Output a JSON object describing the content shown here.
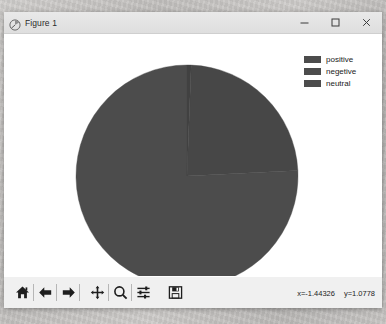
{
  "window": {
    "title": "Figure 1",
    "icon": "matplotlib-figure-icon",
    "minimize_label": "–",
    "maximize_label": "□",
    "close_label": "×"
  },
  "legend": {
    "position": "upper right",
    "items": [
      {
        "label": "positive",
        "color": "#4c4c4c"
      },
      {
        "label": "negetive",
        "color": "#4c4c4c"
      },
      {
        "label": "neutral",
        "color": "#4c4c4c"
      }
    ]
  },
  "toolbar": {
    "buttons": [
      {
        "name": "home-icon",
        "tooltip": "Reset original view"
      },
      {
        "name": "back-arrow-icon",
        "tooltip": "Back to previous view"
      },
      {
        "name": "forward-arrow-icon",
        "tooltip": "Forward to next view"
      },
      {
        "name": "pan-move-icon",
        "tooltip": "Pan axes with left mouse, zoom with right"
      },
      {
        "name": "zoom-rect-icon",
        "tooltip": "Zoom to rectangle"
      },
      {
        "name": "configure-subplots-icon",
        "tooltip": "Configure subplots"
      },
      {
        "name": "save-disk-icon",
        "tooltip": "Save the figure"
      }
    ],
    "coordinates": {
      "x": "x=-1.44326",
      "y": "y=1.0778"
    }
  },
  "chart_data": {
    "type": "pie",
    "title": "",
    "labels": [
      "positive",
      "negetive",
      "neutral"
    ],
    "values": [
      75.8,
      23.6,
      0.6
    ],
    "units": "percent",
    "colors": [
      "#4c4c4c",
      "#474747",
      "#414141"
    ],
    "startangle": 90,
    "counterclock": true,
    "center": {
      "x": 183,
      "y": 142
    },
    "radius": 111,
    "legend": [
      "positive",
      "negetive",
      "neutral"
    ],
    "grid": false,
    "axes_visible": false
  }
}
